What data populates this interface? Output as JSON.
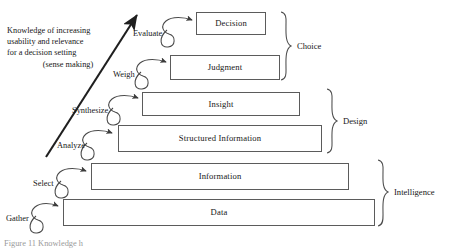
{
  "figure": {
    "caption": "Figure 11 Knowledge h",
    "background_color": "#ffffff",
    "line_color": "#5b5b5b",
    "text_color": "#171717"
  },
  "annotation": {
    "line1": "Knowledge of increasing",
    "line2": "usability and relevance",
    "line3": "for a decision setting",
    "line4": "(sense making)",
    "arrow_name": "upward-diagonal-arrow"
  },
  "levels": [
    {
      "label": "Decision",
      "verb": "Evaluate",
      "group": "Choice"
    },
    {
      "label": "Judgment",
      "verb": "Weigh",
      "group": "Choice"
    },
    {
      "label": "Insight",
      "verb": "Synthesize",
      "group": "Design"
    },
    {
      "label": "Structured Information",
      "verb": "Analyze",
      "group": "Design"
    },
    {
      "label": "Information",
      "verb": "Select",
      "group": "Intelligence"
    },
    {
      "label": "Data",
      "verb": "Gather",
      "group": "Intelligence"
    }
  ],
  "groups": [
    {
      "label": "Choice"
    },
    {
      "label": "Design"
    },
    {
      "label": "Intelligence"
    }
  ]
}
